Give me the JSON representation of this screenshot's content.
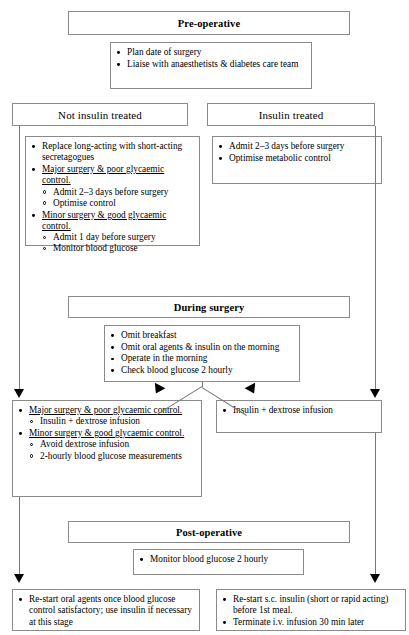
{
  "diagram": {
    "stages": {
      "preoperative": "Pre-operative",
      "during_surgery": "During surgery",
      "postoperative": "Post-operative"
    },
    "preop_actions": [
      "Plan date of surgery",
      "Liaise with anaesthetists & diabetes care team"
    ],
    "branches": {
      "not_insulin_treated": "Not insulin treated",
      "insulin_treated": "Insulin treated"
    },
    "not_insulin_treated_items": [
      {
        "text": "Replace long-acting with short-acting secretagogues",
        "underline": false,
        "sub": []
      },
      {
        "text": "Major surgery & poor glycaemic control.",
        "underline": true,
        "sub": [
          "Admit 2–3 days before surgery",
          "Optimise control"
        ]
      },
      {
        "text": "Minor surgery & good glycaemic control.",
        "underline": true,
        "sub": [
          "Admit 1 day before surgery",
          "Monitor blood glucose"
        ]
      }
    ],
    "insulin_treated_items": [
      {
        "text": "Admit 2–3 days before surgery",
        "underline": false,
        "sub": []
      },
      {
        "text": "Optimise metabolic control",
        "underline": false,
        "sub": []
      }
    ],
    "during_surgery_items": [
      "Omit breakfast",
      "Omit oral agents & insulin on the morning",
      "Operate in the morning",
      "Check blood glucose 2 hourly"
    ],
    "intraop_left_items": [
      {
        "text": "Major surgery & poor glycaemic control.",
        "underline": true,
        "sub": [
          "Insulin + dextrose infusion"
        ]
      },
      {
        "text": "Minor surgery & good glycaemic control.",
        "underline": true,
        "sub": [
          "Avoid dextrose infusion",
          "2-hourly blood glucose measurements"
        ]
      }
    ],
    "intraop_right_items": [
      {
        "text": "Insulin + dextrose infusion",
        "underline": false,
        "sub": []
      }
    ],
    "postop_monitor_items": [
      "Monitor blood glucose 2  hourly"
    ],
    "postop_left_items": [
      "Re-start oral agents once blood glucose control satisfactory; use insulin if necessary at this stage"
    ],
    "postop_right_items": [
      "Re-start s.c. insulin (short or rapid  acting) before 1st meal.",
      "Terminate i.v. infusion 30 min later"
    ]
  }
}
